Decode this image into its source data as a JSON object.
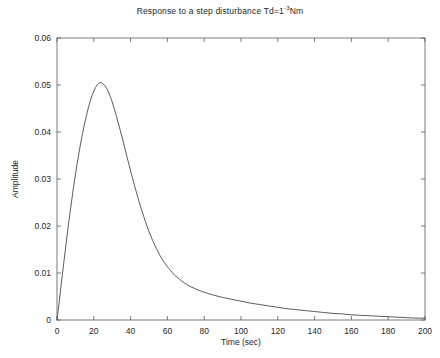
{
  "chart_data": {
    "type": "line",
    "title": "Response to a step disturbance Td=1",
    "title_superscript": "-3",
    "title_suffix": "Nm",
    "title_plain": "Response to a step disturbance Td=1-3Nm",
    "xlabel": "Time (sec)",
    "ylabel": "Amplitude",
    "xlim": [
      0,
      200
    ],
    "ylim": [
      0,
      0.06
    ],
    "xticks": [
      0,
      20,
      40,
      60,
      80,
      100,
      120,
      140,
      160,
      180,
      200
    ],
    "xticklabels": [
      "0",
      "20",
      "40",
      "60",
      "80",
      "100",
      "120",
      "140",
      "160",
      "180",
      "200"
    ],
    "yticks": [
      0,
      0.01,
      0.02,
      0.03,
      0.04,
      0.05,
      0.06
    ],
    "yticklabels": [
      "0",
      "0.01",
      "0.02",
      "0.03",
      "0.04",
      "0.05",
      "0.06"
    ],
    "grid": false,
    "legend": null,
    "series": [
      {
        "name": "step disturbance response",
        "color": "#4a4a4a",
        "peak_x": 23,
        "peak_y": 0.0505,
        "x": [
          0,
          1,
          2,
          3,
          4,
          5,
          6,
          7,
          8,
          9,
          10,
          11,
          12,
          13,
          14,
          15,
          16,
          17,
          18,
          19,
          20,
          21,
          22,
          23,
          24,
          25,
          26,
          27,
          28,
          29,
          30,
          32,
          34,
          36,
          38,
          40,
          42,
          44,
          46,
          48,
          50,
          52,
          54,
          56,
          58,
          60,
          64,
          68,
          72,
          76,
          80,
          85,
          90,
          95,
          100,
          105,
          110,
          115,
          120,
          125,
          130,
          135,
          140,
          145,
          150,
          155,
          160,
          165,
          170,
          175,
          180,
          185,
          190,
          195,
          200
        ],
        "y": [
          0,
          0.0032,
          0.0066,
          0.0099,
          0.0132,
          0.0164,
          0.0196,
          0.0226,
          0.0255,
          0.0283,
          0.0309,
          0.0334,
          0.0357,
          0.0379,
          0.0399,
          0.0418,
          0.0435,
          0.0451,
          0.0465,
          0.0477,
          0.0487,
          0.0495,
          0.0501,
          0.0505,
          0.0505,
          0.0503,
          0.0499,
          0.0493,
          0.0485,
          0.0475,
          0.0464,
          0.0438,
          0.0409,
          0.0379,
          0.0348,
          0.0317,
          0.0288,
          0.026,
          0.0234,
          0.021,
          0.0188,
          0.0169,
          0.0152,
          0.0137,
          0.0124,
          0.0113,
          0.0095,
          0.0082,
          0.0072,
          0.0065,
          0.0059,
          0.0053,
          0.0048,
          0.0044,
          0.004,
          0.0036,
          0.0033,
          0.003,
          0.0027,
          0.0024,
          0.0022,
          0.002,
          0.0018,
          0.0016,
          0.0014,
          0.0013,
          0.0011,
          0.001,
          0.0009,
          0.0008,
          0.0007,
          0.0006,
          0.0005,
          0.0004,
          0.0004
        ]
      }
    ]
  }
}
